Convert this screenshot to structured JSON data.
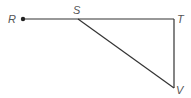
{
  "diagram": {
    "points": {
      "R": {
        "label": "R",
        "x": 23,
        "y": 19
      },
      "S": {
        "label": "S",
        "x": 78,
        "y": 19
      },
      "T": {
        "label": "T",
        "x": 174,
        "y": 19
      },
      "V": {
        "label": "V",
        "x": 174,
        "y": 88
      }
    },
    "segments": [
      "RT",
      "SV",
      "TV"
    ],
    "line_color": "#333333",
    "label_color": "#555555"
  }
}
